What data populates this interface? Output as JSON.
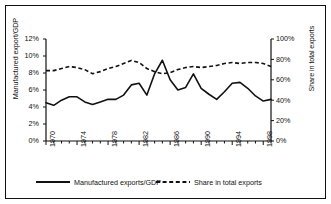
{
  "chart_data": {
    "type": "line",
    "title": "",
    "xlabel": "",
    "ylabel": "Manufactured export/GDP",
    "y2label": "Share in total exports",
    "grid": false,
    "legend_position": "bottom",
    "xlim": [
      1970,
      1999
    ],
    "ylim": [
      0,
      12
    ],
    "y2lim": [
      0,
      100
    ],
    "x": [
      1970,
      1971,
      1972,
      1973,
      1974,
      1975,
      1976,
      1977,
      1978,
      1979,
      1980,
      1981,
      1982,
      1983,
      1984,
      1985,
      1986,
      1987,
      1988,
      1989,
      1990,
      1991,
      1992,
      1993,
      1994,
      1995,
      1996,
      1997,
      1998,
      1999
    ],
    "xticks": [
      "1970",
      "1974",
      "1978",
      "1982",
      "1986",
      "1990",
      "1994",
      "1998"
    ],
    "xtick_values": [
      1970,
      1974,
      1978,
      1982,
      1986,
      1990,
      1994,
      1998
    ],
    "yticks": [
      "0%",
      "2%",
      "4%",
      "6%",
      "8%",
      "10%",
      "12%"
    ],
    "ytick_values": [
      0,
      2,
      4,
      6,
      8,
      10,
      12
    ],
    "y2ticks": [
      "0%",
      "20%",
      "40%",
      "60%",
      "80%",
      "100%"
    ],
    "y2tick_values": [
      0,
      20,
      40,
      60,
      80,
      100
    ],
    "series": [
      {
        "name": "Manufactured exports/GDP",
        "axis": "left",
        "style": "solid",
        "color": "#111111",
        "values": [
          4.5,
          4.2,
          4.8,
          5.2,
          5.2,
          4.6,
          4.3,
          4.6,
          4.9,
          4.9,
          5.4,
          6.6,
          6.8,
          5.4,
          7.9,
          9.5,
          7.2,
          6.0,
          6.3,
          7.9,
          6.2,
          5.5,
          4.9,
          5.8,
          6.8,
          6.9,
          6.2,
          5.3,
          4.7,
          4.9
        ]
      },
      {
        "name": "Share in total exports",
        "axis": "right",
        "style": "dashed",
        "color": "#111111",
        "values": [
          69,
          69,
          71,
          73,
          72,
          70,
          66,
          68,
          71,
          73,
          76,
          79,
          77,
          71,
          68,
          66,
          67,
          70,
          72,
          73,
          72,
          73,
          74,
          76,
          77,
          76,
          77,
          77,
          76,
          73
        ]
      }
    ]
  },
  "legend": {
    "items": [
      {
        "label": "Manufactured exports/GDP",
        "style": "solid"
      },
      {
        "label": "Share in total exports",
        "style": "dashed"
      }
    ]
  }
}
